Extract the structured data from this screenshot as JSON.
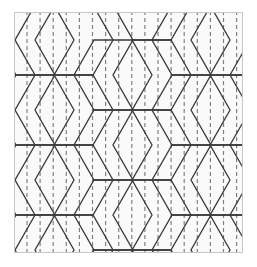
{
  "figure": {
    "canvas": {
      "width": 257,
      "height": 267,
      "background": "#ffffff"
    },
    "frame": {
      "x": 14,
      "y": 12,
      "width": 229,
      "height": 241,
      "border_color": "#c8c8c8",
      "border_width": 1,
      "fill": "#fafafa"
    },
    "hexagons": {
      "stroke_color": "#3a3a3a",
      "stroke_width": 1.3,
      "fill": "none",
      "flat_edge_orientation": "horizontal-top-bottom",
      "cell_width": 78,
      "cell_height": 70,
      "flat_edge_length": 38,
      "column_step_x": 78,
      "column_offset_x": 39,
      "row_step_y": 70,
      "column_offset_y": 35,
      "origin_x": -19,
      "origin_y": -8,
      "columns": 5,
      "rows": 6
    },
    "dashed_guides": {
      "orientation": "vertical",
      "stroke_color": "#808080",
      "stroke_width": 1.2,
      "dash_length": 4,
      "gap_length": 3,
      "spacing": 13.1,
      "start_x": 12,
      "count": 18
    }
  }
}
